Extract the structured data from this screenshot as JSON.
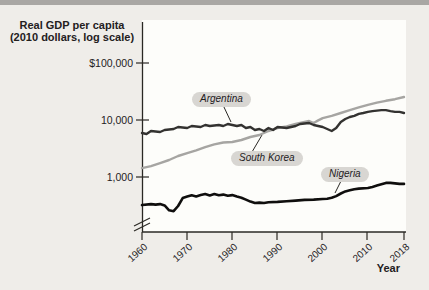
{
  "figure": {
    "title_line1": "Real GDP per capita",
    "title_line2": "(2010 dollars, log scale)",
    "x_axis_title": "Year"
  },
  "chart_data": {
    "type": "line",
    "title": "Real GDP per capita (2010 dollars, log scale)",
    "xlabel": "Year",
    "ylabel": "Real GDP per capita (2010 dollars, log scale)",
    "y_scale": "log",
    "y_axis_break": true,
    "grid": false,
    "legend": "inline-labels",
    "x_range": [
      1960,
      2018
    ],
    "y_tick_labels": [
      "$100,000",
      "10,000",
      "1,000"
    ],
    "y_tick_values": [
      100000,
      10000,
      1000
    ],
    "x_tick_labels": [
      "1960",
      "1970",
      "1980",
      "1990",
      "2000",
      "2010",
      "2018"
    ],
    "x_tick_values": [
      1960,
      1970,
      1980,
      1990,
      2000,
      2010,
      2018
    ],
    "series": [
      {
        "name": "Argentina",
        "color": "#333230",
        "points": [
          [
            1960,
            5890
          ],
          [
            1961,
            5660
          ],
          [
            1962,
            6390
          ],
          [
            1964,
            6140
          ],
          [
            1965,
            6650
          ],
          [
            1967,
            6930
          ],
          [
            1968,
            7520
          ],
          [
            1970,
            7220
          ],
          [
            1971,
            7830
          ],
          [
            1973,
            7520
          ],
          [
            1974,
            8160
          ],
          [
            1975,
            7830
          ],
          [
            1977,
            8160
          ],
          [
            1978,
            7830
          ],
          [
            1979,
            8500
          ],
          [
            1981,
            7830
          ],
          [
            1982,
            8160
          ],
          [
            1983,
            7220
          ],
          [
            1984,
            7520
          ],
          [
            1985,
            6650
          ],
          [
            1986,
            6930
          ],
          [
            1987,
            6390
          ],
          [
            1988,
            7220
          ],
          [
            1989,
            6650
          ],
          [
            1990,
            7520
          ],
          [
            1992,
            7220
          ],
          [
            1993,
            7520
          ],
          [
            1994,
            7830
          ],
          [
            1995,
            8500
          ],
          [
            1997,
            8850
          ],
          [
            1998,
            8160
          ],
          [
            1999,
            7830
          ],
          [
            2000,
            7520
          ],
          [
            2001,
            6930
          ],
          [
            2002,
            6390
          ],
          [
            2003,
            7220
          ],
          [
            2004,
            9230
          ],
          [
            2005,
            10400
          ],
          [
            2006,
            11300
          ],
          [
            2007,
            11800
          ],
          [
            2008,
            12800
          ],
          [
            2009,
            13300
          ],
          [
            2010,
            13900
          ],
          [
            2011,
            14400
          ],
          [
            2013,
            15000
          ],
          [
            2014,
            15000
          ],
          [
            2015,
            14400
          ],
          [
            2016,
            13900
          ],
          [
            2017,
            13900
          ],
          [
            2018,
            13300
          ]
        ]
      },
      {
        "name": "South Korea",
        "color": "#a6a5a2",
        "points": [
          [
            1960,
            1410
          ],
          [
            1962,
            1530
          ],
          [
            1964,
            1730
          ],
          [
            1966,
            1960
          ],
          [
            1968,
            2310
          ],
          [
            1970,
            2600
          ],
          [
            1972,
            2900
          ],
          [
            1974,
            3300
          ],
          [
            1976,
            3700
          ],
          [
            1978,
            4000
          ],
          [
            1980,
            4080
          ],
          [
            1982,
            4430
          ],
          [
            1984,
            5000
          ],
          [
            1986,
            5430
          ],
          [
            1988,
            6390
          ],
          [
            1990,
            7220
          ],
          [
            1992,
            7700
          ],
          [
            1994,
            8500
          ],
          [
            1996,
            9230
          ],
          [
            1997,
            9600
          ],
          [
            1998,
            8850
          ],
          [
            1999,
            9850
          ],
          [
            2000,
            10800
          ],
          [
            2002,
            11800
          ],
          [
            2004,
            13300
          ],
          [
            2006,
            15000
          ],
          [
            2008,
            16700
          ],
          [
            2010,
            18600
          ],
          [
            2012,
            20200
          ],
          [
            2014,
            21900
          ],
          [
            2016,
            23300
          ],
          [
            2018,
            25500
          ]
        ]
      },
      {
        "name": "Nigeria",
        "color": "#0f0e0d",
        "points": [
          [
            1960,
            313
          ],
          [
            1962,
            325
          ],
          [
            1963,
            318
          ],
          [
            1964,
            325
          ],
          [
            1965,
            308
          ],
          [
            1966,
            252
          ],
          [
            1967,
            243
          ],
          [
            1968,
            300
          ],
          [
            1969,
            415
          ],
          [
            1970,
            440
          ],
          [
            1971,
            465
          ],
          [
            1972,
            445
          ],
          [
            1973,
            470
          ],
          [
            1974,
            490
          ],
          [
            1975,
            462
          ],
          [
            1976,
            488
          ],
          [
            1977,
            465
          ],
          [
            1978,
            478
          ],
          [
            1979,
            455
          ],
          [
            1980,
            468
          ],
          [
            1981,
            440
          ],
          [
            1982,
            420
          ],
          [
            1983,
            390
          ],
          [
            1984,
            360
          ],
          [
            1985,
            340
          ],
          [
            1986,
            345
          ],
          [
            1987,
            340
          ],
          [
            1988,
            350
          ],
          [
            1990,
            355
          ],
          [
            1992,
            365
          ],
          [
            1994,
            375
          ],
          [
            1996,
            385
          ],
          [
            1998,
            390
          ],
          [
            2000,
            400
          ],
          [
            2001,
            405
          ],
          [
            2002,
            420
          ],
          [
            2003,
            450
          ],
          [
            2004,
            500
          ],
          [
            2005,
            545
          ],
          [
            2006,
            570
          ],
          [
            2007,
            595
          ],
          [
            2008,
            610
          ],
          [
            2010,
            625
          ],
          [
            2011,
            655
          ],
          [
            2012,
            690
          ],
          [
            2013,
            730
          ],
          [
            2014,
            770
          ],
          [
            2015,
            770
          ],
          [
            2016,
            755
          ],
          [
            2017,
            740
          ],
          [
            2018,
            740
          ]
        ]
      }
    ]
  },
  "colors": {
    "page_background": "#efede9",
    "plot_background": "#fdfdfa",
    "top_bar": "#a9a7a4",
    "axis": "#2a2824",
    "label_chip_background": "#d8d6d2",
    "text": "#23201d"
  }
}
